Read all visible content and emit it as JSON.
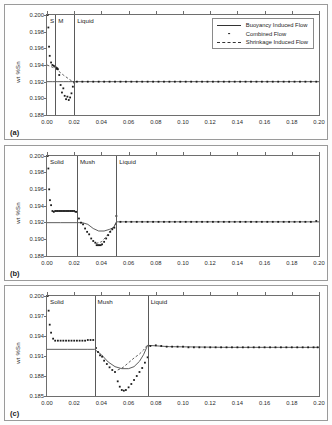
{
  "figure": {
    "ylabel": "wt %Sn",
    "legend": [
      {
        "label": "Buoyancy Induced Flow",
        "style": "solid-line"
      },
      {
        "label": "Combined Flow",
        "style": "dot-marker"
      },
      {
        "label": "Shrinkage Induced Flow",
        "style": "dashed-line"
      }
    ]
  },
  "chart_data": [
    {
      "type": "scatter",
      "panel": "(a)",
      "title": "",
      "xlabel": "",
      "ylabel": "wt %Sn",
      "xlim": [
        0.0,
        0.2
      ],
      "ylim": [
        0.188,
        0.2
      ],
      "xticks": [
        "0.00",
        "0.02",
        "0.04",
        "0.06",
        "0.08",
        "0.10",
        "0.12",
        "0.14",
        "0.16",
        "0.18",
        "0.20"
      ],
      "yticks": [
        "0.188",
        "0.190",
        "0.192",
        "0.194",
        "0.196",
        "0.198",
        "0.200"
      ],
      "grid": false,
      "zones": [
        {
          "label": "S",
          "start": 0.0,
          "end": 0.006
        },
        {
          "label": "M",
          "start": 0.006,
          "end": 0.02
        },
        {
          "label": "Liquid",
          "start": 0.02,
          "end": 0.2
        }
      ],
      "zone_boundaries": [
        0.006,
        0.02
      ],
      "series": [
        {
          "name": "Buoyancy Induced Flow",
          "style": "solid-line",
          "x": [
            0.0,
            0.004,
            0.008,
            0.012,
            0.016,
            0.02,
            0.04,
            0.08,
            0.12,
            0.16,
            0.2
          ],
          "y": [
            0.192,
            0.192,
            0.192,
            0.192,
            0.192,
            0.192,
            0.192,
            0.192,
            0.192,
            0.192,
            0.192
          ]
        },
        {
          "name": "Shrinkage Induced Flow",
          "style": "dashed-line",
          "x": [
            0.0,
            0.006,
            0.012,
            0.018,
            0.02
          ],
          "y": [
            0.194,
            0.1936,
            0.1928,
            0.1921,
            0.192
          ]
        },
        {
          "name": "Combined Flow",
          "style": "dot-marker",
          "x": [
            0.0005,
            0.001,
            0.0015,
            0.002,
            0.003,
            0.004,
            0.005,
            0.006,
            0.0065,
            0.007,
            0.0075,
            0.008,
            0.009,
            0.01,
            0.011,
            0.012,
            0.013,
            0.014,
            0.015,
            0.016,
            0.017,
            0.018,
            0.019,
            0.02,
            0.022,
            0.026,
            0.03,
            0.034,
            0.038,
            0.042,
            0.046,
            0.05,
            0.054,
            0.058,
            0.062,
            0.066,
            0.07,
            0.074,
            0.078,
            0.082,
            0.086,
            0.09,
            0.094,
            0.098,
            0.102,
            0.106,
            0.11,
            0.114,
            0.118,
            0.122,
            0.126,
            0.13,
            0.134,
            0.138,
            0.142,
            0.146,
            0.15,
            0.154,
            0.158,
            0.162,
            0.166,
            0.17,
            0.174,
            0.178,
            0.182,
            0.186,
            0.19,
            0.194,
            0.198
          ],
          "y": [
            0.2,
            0.1985,
            0.1962,
            0.1951,
            0.1943,
            0.194,
            0.1939,
            0.1938,
            0.1937,
            0.1936,
            0.1936,
            0.1935,
            0.1928,
            0.1916,
            0.1907,
            0.1912,
            0.1903,
            0.1899,
            0.1902,
            0.1898,
            0.1901,
            0.1906,
            0.1914,
            0.1919,
            0.192,
            0.192,
            0.192,
            0.192,
            0.192,
            0.192,
            0.192,
            0.192,
            0.192,
            0.192,
            0.192,
            0.192,
            0.192,
            0.192,
            0.192,
            0.192,
            0.192,
            0.192,
            0.192,
            0.192,
            0.192,
            0.192,
            0.192,
            0.192,
            0.192,
            0.192,
            0.192,
            0.192,
            0.192,
            0.192,
            0.192,
            0.192,
            0.192,
            0.192,
            0.192,
            0.192,
            0.192,
            0.192,
            0.192,
            0.192,
            0.192,
            0.192,
            0.192,
            0.192,
            0.192
          ]
        }
      ]
    },
    {
      "type": "scatter",
      "panel": "(b)",
      "title": "",
      "xlabel": "",
      "ylabel": "wt %Sn",
      "xlim": [
        0.0,
        0.2
      ],
      "ylim": [
        0.188,
        0.2
      ],
      "xticks": [
        "0.00",
        "0.02",
        "0.04",
        "0.06",
        "0.08",
        "0.10",
        "0.12",
        "0.14",
        "0.16",
        "0.18",
        "0.20"
      ],
      "yticks": [
        "0.188",
        "0.190",
        "0.192",
        "0.194",
        "0.196",
        "0.198",
        "0.200"
      ],
      "grid": false,
      "zones": [
        {
          "label": "Solid",
          "start": 0.0,
          "end": 0.022
        },
        {
          "label": "Mush",
          "start": 0.022,
          "end": 0.051
        },
        {
          "label": "Liquid",
          "start": 0.051,
          "end": 0.2
        }
      ],
      "zone_boundaries": [
        0.022,
        0.051
      ],
      "series": [
        {
          "name": "Buoyancy Induced Flow",
          "style": "solid-line",
          "x": [
            0.0,
            0.01,
            0.022,
            0.026,
            0.03,
            0.034,
            0.038,
            0.042,
            0.046,
            0.049,
            0.051,
            0.06,
            0.1,
            0.15,
            0.2
          ],
          "y": [
            0.192,
            0.192,
            0.192,
            0.192,
            0.1918,
            0.1913,
            0.191,
            0.191,
            0.1912,
            0.1914,
            0.1921,
            0.1921,
            0.1921,
            0.1921,
            0.1921
          ]
        },
        {
          "name": "Shrinkage Induced Flow",
          "style": "dashed-line",
          "x": [
            0.036,
            0.04,
            0.044,
            0.047,
            0.05,
            0.051
          ],
          "y": [
            0.1895,
            0.1897,
            0.1904,
            0.1911,
            0.1917,
            0.192
          ]
        },
        {
          "name": "Combined Flow",
          "style": "dot-marker",
          "x": [
            0.0005,
            0.001,
            0.0016,
            0.0022,
            0.003,
            0.004,
            0.005,
            0.006,
            0.007,
            0.008,
            0.009,
            0.01,
            0.011,
            0.012,
            0.013,
            0.014,
            0.015,
            0.016,
            0.017,
            0.018,
            0.019,
            0.02,
            0.021,
            0.022,
            0.0235,
            0.025,
            0.0265,
            0.028,
            0.0295,
            0.031,
            0.0325,
            0.034,
            0.0355,
            0.0365,
            0.0375,
            0.0385,
            0.0395,
            0.0405,
            0.042,
            0.0435,
            0.045,
            0.0465,
            0.048,
            0.0495,
            0.051,
            0.054,
            0.058,
            0.062,
            0.066,
            0.07,
            0.074,
            0.078,
            0.082,
            0.086,
            0.09,
            0.094,
            0.098,
            0.102,
            0.106,
            0.11,
            0.114,
            0.118,
            0.122,
            0.126,
            0.13,
            0.134,
            0.138,
            0.142,
            0.146,
            0.15,
            0.154,
            0.158,
            0.162,
            0.166,
            0.17,
            0.174,
            0.178,
            0.182,
            0.186,
            0.19,
            0.194,
            0.198
          ],
          "y": [
            0.2,
            0.1985,
            0.196,
            0.1947,
            0.1941,
            0.1934,
            0.1933,
            0.1934,
            0.1934,
            0.1934,
            0.1934,
            0.1934,
            0.1934,
            0.1934,
            0.1934,
            0.1934,
            0.1934,
            0.1934,
            0.1934,
            0.1934,
            0.1934,
            0.1934,
            0.1933,
            0.1933,
            0.1925,
            0.192,
            0.1918,
            0.1913,
            0.1909,
            0.1906,
            0.1901,
            0.1898,
            0.1896,
            0.1893,
            0.1893,
            0.1893,
            0.1893,
            0.1894,
            0.1897,
            0.1901,
            0.1905,
            0.1909,
            0.1912,
            0.1914,
            0.1928,
            0.1921,
            0.1921,
            0.1921,
            0.1921,
            0.1921,
            0.1921,
            0.1921,
            0.1921,
            0.1921,
            0.1921,
            0.1921,
            0.1921,
            0.1921,
            0.1921,
            0.1921,
            0.1921,
            0.1921,
            0.1921,
            0.1921,
            0.1921,
            0.1921,
            0.1921,
            0.1921,
            0.1921,
            0.1921,
            0.1921,
            0.1921,
            0.1921,
            0.1921,
            0.1921,
            0.1921,
            0.1921,
            0.1921,
            0.1921,
            0.1921,
            0.1921,
            0.1922
          ]
        }
      ]
    },
    {
      "type": "scatter",
      "panel": "(c)",
      "title": "",
      "xlabel": "",
      "ylabel": "wt %Sn",
      "xlim": [
        0.0,
        0.2
      ],
      "ylim": [
        0.185,
        0.2
      ],
      "xticks": [
        "0.00",
        "0.02",
        "0.04",
        "0.06",
        "0.08",
        "0.10",
        "0.12",
        "0.14",
        "0.16",
        "0.18",
        "0.20"
      ],
      "yticks": [
        "0.185",
        "0.188",
        "0.191",
        "0.194",
        "0.197",
        "0.200"
      ],
      "grid": false,
      "zones": [
        {
          "label": "Solid",
          "start": 0.0,
          "end": 0.035
        },
        {
          "label": "Mush",
          "start": 0.035,
          "end": 0.074
        },
        {
          "label": "Liquid",
          "start": 0.074,
          "end": 0.2
        }
      ],
      "zone_boundaries": [
        0.035,
        0.074
      ],
      "series": [
        {
          "name": "Buoyancy Induced Flow",
          "style": "solid-line",
          "x": [
            0.0,
            0.015,
            0.03,
            0.035,
            0.04,
            0.045,
            0.05,
            0.055,
            0.06,
            0.064,
            0.068,
            0.071,
            0.074,
            0.09,
            0.13,
            0.17,
            0.2
          ],
          "y": [
            0.192,
            0.192,
            0.192,
            0.192,
            0.1912,
            0.1901,
            0.1894,
            0.1891,
            0.1891,
            0.1894,
            0.1902,
            0.1912,
            0.1926,
            0.1924,
            0.1923,
            0.1923,
            0.1923
          ]
        },
        {
          "name": "Shrinkage Induced Flow",
          "style": "dashed-line",
          "x": [
            0.052,
            0.056,
            0.06,
            0.064,
            0.068,
            0.071,
            0.074
          ],
          "y": [
            0.1889,
            0.1893,
            0.19,
            0.1907,
            0.1913,
            0.1919,
            0.1927
          ]
        },
        {
          "name": "Combined Flow",
          "style": "dot-marker",
          "x": [
            0.0005,
            0.0012,
            0.002,
            0.003,
            0.0045,
            0.006,
            0.008,
            0.01,
            0.012,
            0.014,
            0.016,
            0.018,
            0.02,
            0.022,
            0.024,
            0.026,
            0.028,
            0.03,
            0.032,
            0.034,
            0.036,
            0.0375,
            0.039,
            0.0405,
            0.042,
            0.044,
            0.046,
            0.048,
            0.05,
            0.052,
            0.0535,
            0.055,
            0.0565,
            0.058,
            0.06,
            0.062,
            0.064,
            0.066,
            0.068,
            0.07,
            0.072,
            0.074,
            0.076,
            0.08,
            0.084,
            0.088,
            0.092,
            0.096,
            0.1,
            0.104,
            0.108,
            0.112,
            0.116,
            0.12,
            0.124,
            0.128,
            0.132,
            0.136,
            0.14,
            0.144,
            0.148,
            0.152,
            0.156,
            0.16,
            0.164,
            0.168,
            0.172,
            0.176,
            0.18,
            0.184,
            0.188,
            0.192,
            0.196,
            0.199
          ],
          "y": [
            0.2,
            0.1978,
            0.1957,
            0.1945,
            0.1936,
            0.1933,
            0.1933,
            0.1933,
            0.1933,
            0.1933,
            0.1933,
            0.1933,
            0.1933,
            0.1933,
            0.1933,
            0.1933,
            0.1933,
            0.1934,
            0.1934,
            0.1934,
            0.1922,
            0.1916,
            0.1911,
            0.1909,
            0.1903,
            0.1898,
            0.1893,
            0.1889,
            0.1886,
            0.1872,
            0.1864,
            0.1859,
            0.1858,
            0.1859,
            0.1863,
            0.1868,
            0.1874,
            0.188,
            0.1886,
            0.1892,
            0.19,
            0.1908,
            0.1925,
            0.1926,
            0.1925,
            0.1924,
            0.1924,
            0.1924,
            0.1924,
            0.1923,
            0.1923,
            0.1923,
            0.1923,
            0.1923,
            0.1923,
            0.1923,
            0.1923,
            0.1923,
            0.1923,
            0.1923,
            0.1923,
            0.1923,
            0.1923,
            0.1923,
            0.1923,
            0.1923,
            0.1923,
            0.1923,
            0.1923,
            0.1923,
            0.1923,
            0.1923,
            0.1923,
            0.1923
          ]
        }
      ]
    }
  ]
}
